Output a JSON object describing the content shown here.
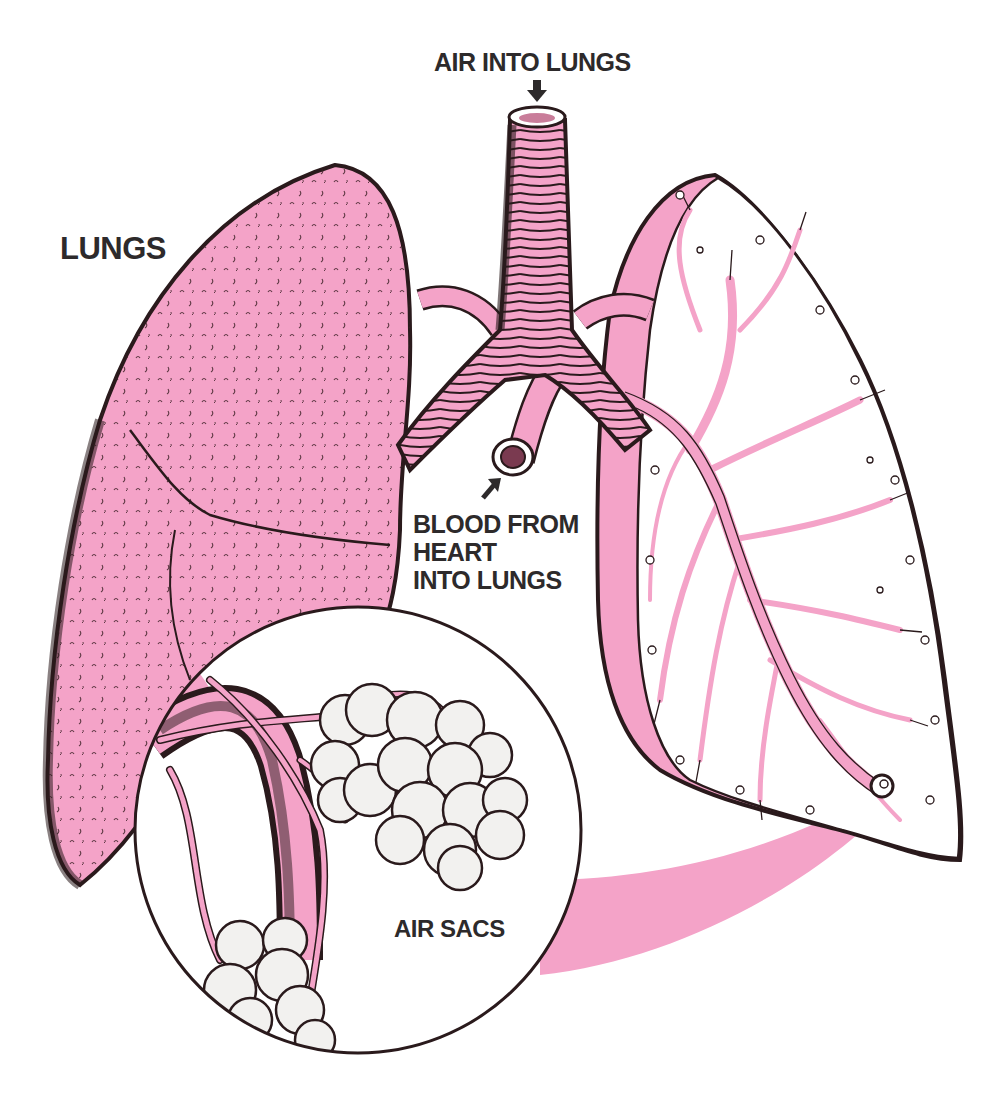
{
  "figure": {
    "title": "Lungs",
    "labels": {
      "lungs": "LUNGS",
      "air_into_lungs": "AIR INTO LUNGS",
      "blood_from_heart": [
        "BLOOD FROM",
        "HEART",
        "INTO LUNGS"
      ],
      "air_sacs": "AIR SACS"
    },
    "parts": [
      "trachea",
      "bronchi",
      "pulmonary-artery",
      "left-lung-exterior",
      "right-lung-cross-section",
      "bronchial-tree",
      "magnified-inset-air-sacs"
    ],
    "colors": {
      "lung_pink": "#f4a3c8",
      "outline": "#2a1a1c",
      "background": "#ffffff",
      "text": "#2d2a2b",
      "sac_fill": "#f2f1ef"
    }
  }
}
